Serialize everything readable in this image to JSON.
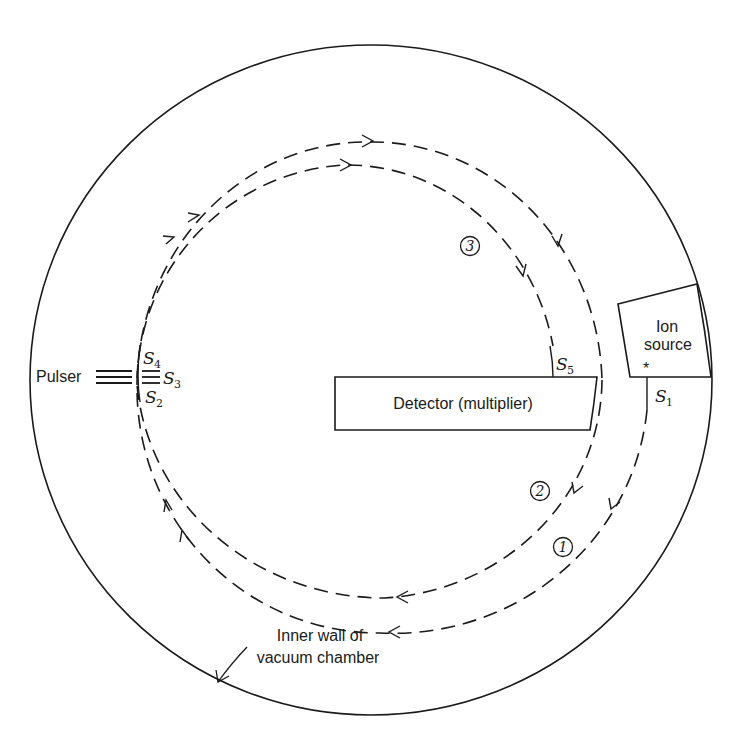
{
  "figure": {
    "labels": {
      "pulser": "Pulser",
      "ion_source_line1": "Ion",
      "ion_source_line2": "source",
      "detector": "Detector (multiplier)",
      "chamber_line1": "Inner wall of",
      "chamber_line2": "vacuum chamber",
      "star": "*"
    },
    "slits": [
      {
        "id": "S1",
        "letter": "S",
        "sub": "1"
      },
      {
        "id": "S2",
        "letter": "S",
        "sub": "2"
      },
      {
        "id": "S3",
        "letter": "S",
        "sub": "3"
      },
      {
        "id": "S4",
        "letter": "S",
        "sub": "4"
      },
      {
        "id": "S5",
        "letter": "S",
        "sub": "5"
      }
    ],
    "path_markers": [
      {
        "id": "1",
        "text": "1"
      },
      {
        "id": "2",
        "text": "2"
      },
      {
        "id": "3",
        "text": "3"
      }
    ],
    "colors": {
      "ink": "#1a1a1a",
      "background": "#ffffff"
    }
  }
}
